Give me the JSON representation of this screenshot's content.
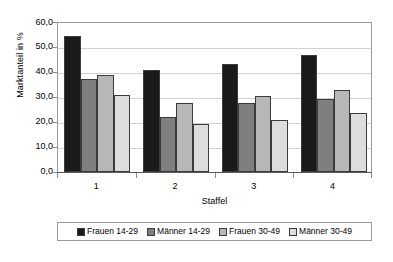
{
  "chart_data": {
    "type": "bar",
    "title": "",
    "xlabel": "Staffel",
    "ylabel": "Marktanteil in %",
    "categories": [
      "1",
      "2",
      "3",
      "4"
    ],
    "ylim": [
      0,
      60
    ],
    "ytick_step": 10,
    "ytick_labels": [
      "60,0",
      "50,0",
      "40,0",
      "30,0",
      "20,0",
      "10,0",
      "0,0"
    ],
    "ytick_values": [
      60,
      50,
      40,
      30,
      20,
      10,
      0
    ],
    "grid": "horizontal",
    "legend_position": "bottom",
    "series": [
      {
        "name": "Frauen 14-29",
        "color": "#1a1a1a",
        "values": [
          54.5,
          41.0,
          43.4,
          47.1
        ]
      },
      {
        "name": "Männer 14-29",
        "color": "#7f7f7f",
        "values": [
          37.2,
          21.9,
          27.7,
          29.5
        ]
      },
      {
        "name": "Frauen 30-49",
        "color": "#b7b7b7",
        "values": [
          39.1,
          27.5,
          30.7,
          33.0
        ]
      },
      {
        "name": "Männer 30-49",
        "color": "#dddddd",
        "values": [
          31.0,
          19.2,
          21.0,
          23.8
        ]
      }
    ]
  },
  "axes": {
    "y_title": "Marktanteil in %",
    "x_title": "Staffel"
  },
  "legend": {
    "items": [
      {
        "label": "Frauen 14-29",
        "color": "#1a1a1a"
      },
      {
        "label": "Männer 14-29",
        "color": "#7f7f7f"
      },
      {
        "label": "Frauen 30-49",
        "color": "#b7b7b7"
      },
      {
        "label": "Männer 30-49",
        "color": "#dddddd"
      }
    ]
  },
  "colors": {
    "plot_background": "#ffffff",
    "frame": "#9a9a9a",
    "gridline": "#d2d2d2",
    "bar_outline": "#3b3b3b"
  }
}
